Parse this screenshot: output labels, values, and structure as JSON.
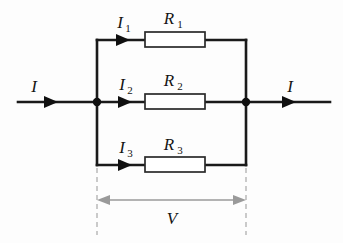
{
  "diagram": {
    "type": "electrical-schematic",
    "background_color": "#fdfdfd",
    "wire_color": "#1a1a1a",
    "dimension_color": "#9a9a9a",
    "dash_color": "#b0b0b0",
    "resistor_fill": "#ffffff",
    "resistor_stroke": "#2a2a2a"
  },
  "labels": {
    "current_in": "I",
    "current_out": "I",
    "branch1_current": "I",
    "branch1_current_sub": "1",
    "branch2_current": "I",
    "branch2_current_sub": "2",
    "branch3_current": "I",
    "branch3_current_sub": "3",
    "resistor1": "R",
    "resistor1_sub": "1",
    "resistor2": "R",
    "resistor2_sub": "2",
    "resistor3": "R",
    "resistor3_sub": "3",
    "voltage": "V"
  },
  "branches": [
    {
      "name": "top-branch",
      "current": "I1",
      "resistor": "R1",
      "rail_y": 40
    },
    {
      "name": "middle-branch",
      "current": "I2",
      "resistor": "R2",
      "rail_y": 102
    },
    {
      "name": "bottom-branch",
      "current": "I3",
      "resistor": "R3",
      "rail_y": 165
    }
  ],
  "nodes": {
    "left_junction_x": 97,
    "right_junction_x": 246,
    "junction_y": 102
  },
  "dimension": {
    "label": "V",
    "from_x": 97,
    "to_x": 246,
    "y": 200
  }
}
